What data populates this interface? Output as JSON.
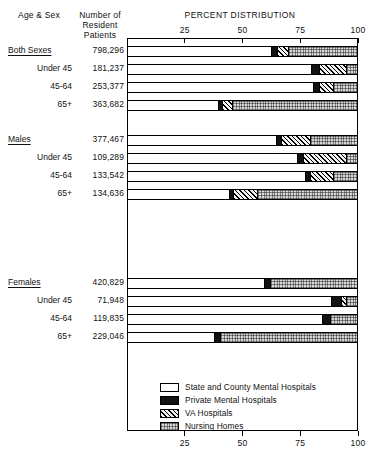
{
  "header": {
    "col_agesex": "Age & Sex",
    "col_number": "Number of\nResident\nPatients",
    "col_percent": "PERCENT DISTRIBUTION"
  },
  "axis": {
    "ticks": [
      "25",
      "50",
      "75",
      "100"
    ],
    "tick_values": [
      25,
      50,
      75,
      100
    ],
    "min": 0,
    "max": 100
  },
  "legend": [
    {
      "key": "state",
      "label": "State and County Mental Hospitals"
    },
    {
      "key": "private",
      "label": "Private Mental Hospitals"
    },
    {
      "key": "va",
      "label": "VA Hospitals"
    },
    {
      "key": "nursing",
      "label": "Nursing Homes"
    }
  ],
  "colors": {
    "state": "#ffffff",
    "private": "#121212",
    "va": "#f2f2f2",
    "nursing": "#d8d8d8",
    "outline": "#000000",
    "background": "#ffffff"
  },
  "chart_data": {
    "type": "bar",
    "orientation": "horizontal",
    "stacked": true,
    "title": "PERCENT DISTRIBUTION",
    "xlabel": "",
    "ylabel": "Age & Sex",
    "xlim": [
      0,
      100
    ],
    "grid": false,
    "legend_position": "bottom-right",
    "series": [
      {
        "name": "State and County Mental Hospitals",
        "key": "state",
        "values": [
          62.3,
          80.1,
          81.0,
          39.4,
          64.5,
          74.0,
          77.1,
          44.2,
          59.3,
          88.7,
          84.8,
          37.7
        ]
      },
      {
        "name": "Private Mental Hospitals",
        "key": "private",
        "values": [
          2.6,
          3.5,
          2.6,
          1.7,
          2.2,
          2.6,
          2.2,
          1.7,
          2.6,
          4.3,
          3.5,
          2.6
        ]
      },
      {
        "name": "VA Hospitals",
        "key": "va",
        "values": [
          4.8,
          11.7,
          6.1,
          4.3,
          12.6,
          18.6,
          10.4,
          10.4,
          0.0,
          2.2,
          0.0,
          0.0
        ]
      },
      {
        "name": "Nursing Homes",
        "key": "nursing",
        "values": [
          30.3,
          4.7,
          10.3,
          54.6,
          20.7,
          4.8,
          10.3,
          43.7,
          38.1,
          4.8,
          11.7,
          59.7
        ]
      }
    ],
    "categories": [
      "Both Sexes",
      "Under 45",
      "45-64",
      "65+",
      "Males",
      "Under 45",
      "45-64",
      "65+",
      "Females",
      "Under 45",
      "45-64",
      "65+"
    ]
  },
  "rows": [
    {
      "label": "Both Sexes",
      "group": true,
      "number": "798,296",
      "segments": [
        62.3,
        2.6,
        4.8,
        30.3
      ]
    },
    {
      "label": "Under 45",
      "group": false,
      "number": "181,237",
      "segments": [
        80.1,
        3.5,
        11.7,
        4.7
      ]
    },
    {
      "label": "45-64",
      "group": false,
      "number": "253,377",
      "segments": [
        81.0,
        2.6,
        6.1,
        10.3
      ]
    },
    {
      "label": "65+",
      "group": false,
      "number": "363,682",
      "segments": [
        39.4,
        1.7,
        4.3,
        54.6
      ]
    },
    {
      "label": "Males",
      "group": true,
      "number": "377,467",
      "segments": [
        64.5,
        2.2,
        12.6,
        20.7
      ]
    },
    {
      "label": "Under 45",
      "group": false,
      "number": "109,289",
      "segments": [
        74.0,
        2.6,
        18.6,
        4.8
      ]
    },
    {
      "label": "45-64",
      "group": false,
      "number": "133,542",
      "segments": [
        77.1,
        2.2,
        10.4,
        10.3
      ]
    },
    {
      "label": "65+",
      "group": false,
      "number": "134,636",
      "segments": [
        44.2,
        1.7,
        10.4,
        43.7
      ]
    },
    {
      "label": "Females",
      "group": true,
      "number": "420,829",
      "segments": [
        59.3,
        2.6,
        0.0,
        38.1
      ]
    },
    {
      "label": "Under 45",
      "group": false,
      "number": "71,948",
      "segments": [
        88.7,
        4.3,
        2.2,
        4.8
      ]
    },
    {
      "label": "45-64",
      "group": false,
      "number": "119,835",
      "segments": [
        84.8,
        3.5,
        0.0,
        11.7
      ]
    },
    {
      "label": "65+",
      "group": false,
      "number": "229,046",
      "segments": [
        37.7,
        2.6,
        0.0,
        59.7
      ]
    }
  ],
  "layout": {
    "plot_left": 127,
    "plot_top": 38,
    "plot_width": 231,
    "plot_height": 393,
    "row_tops": [
      46,
      64,
      82,
      100,
      135,
      153,
      171,
      189,
      278,
      296,
      314,
      332
    ],
    "bar_height": 11
  }
}
